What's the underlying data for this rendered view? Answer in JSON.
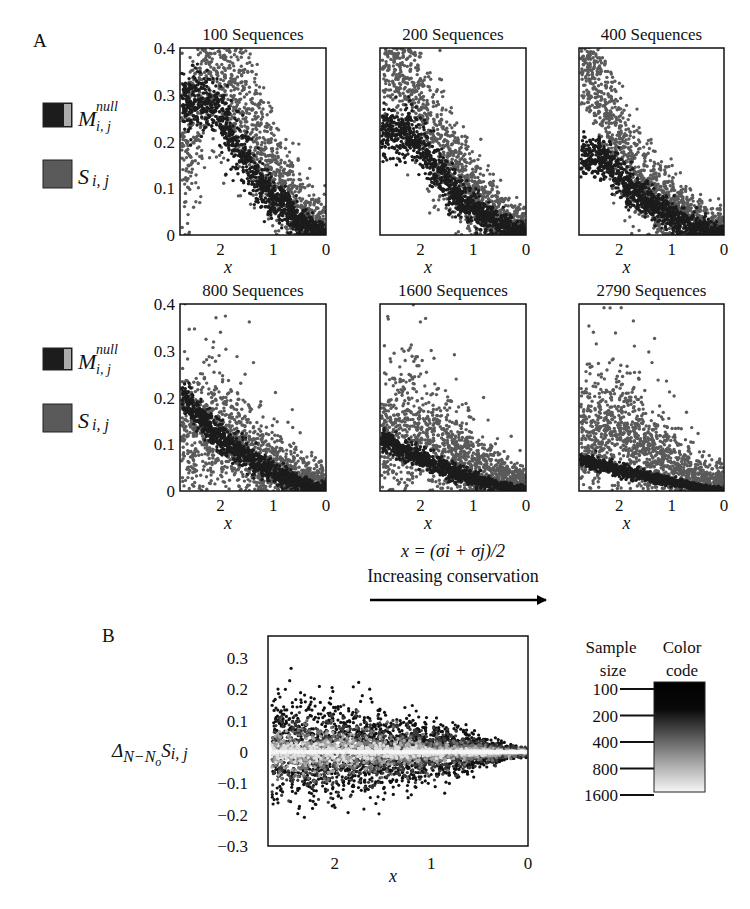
{
  "figure": {
    "panel_a_label": "A",
    "panel_b_label": "B",
    "x_definition": "x = (σi + σj)/2",
    "arrow_caption": "Increasing conservation"
  },
  "legend_a": [
    {
      "symbol": "M",
      "sup": "null",
      "sub": "i, j",
      "color": "#1c1c1c"
    },
    {
      "symbol": "S",
      "sup": "",
      "sub": "i, j",
      "color": "#5a5a5a"
    }
  ],
  "colors": {
    "null_model": "#1c1c1c",
    "observed": "#5a5a5a",
    "frame": "#111111"
  },
  "chart_data": [
    {
      "type": "scatter",
      "panel": "A1",
      "title": "100 Sequences",
      "xlabel": "x",
      "ylabel": "",
      "xlim": [
        2.77,
        0
      ],
      "ylim": [
        0,
        0.4
      ],
      "xticks": [
        "2",
        "1",
        "0"
      ],
      "yticks": [
        "0",
        "0.1",
        "0.2",
        "0.3",
        "0.4"
      ],
      "series": [
        {
          "name": "S_ij",
          "color": "#5a5a5a",
          "profile": {
            "center": [
              [
                2.6,
                0.2
              ],
              [
                2.2,
                0.4
              ],
              [
                1.6,
                0.3
              ],
              [
                1.0,
                0.12
              ],
              [
                0.3,
                0.02
              ]
            ],
            "spread": 0.16
          }
        },
        {
          "name": "M_null_ij",
          "color": "#1c1c1c",
          "profile": {
            "center": [
              [
                2.1,
                0.28
              ],
              [
                1.6,
                0.17
              ],
              [
                1.1,
                0.09
              ],
              [
                0.5,
                0.03
              ],
              [
                0.1,
                0.005
              ]
            ],
            "spread": 0.06
          }
        }
      ]
    },
    {
      "type": "scatter",
      "panel": "A2",
      "title": "200 Sequences",
      "xlabel": "x",
      "ylabel": "",
      "xlim": [
        2.77,
        0
      ],
      "ylim": [
        0,
        0.4
      ],
      "xticks": [
        "2",
        "1",
        "0"
      ],
      "yticks": [],
      "series": [
        {
          "name": "S_ij",
          "color": "#5a5a5a",
          "profile": {
            "center": [
              [
                2.6,
                0.4
              ],
              [
                2.1,
                0.3
              ],
              [
                1.6,
                0.18
              ],
              [
                1.0,
                0.08
              ],
              [
                0.3,
                0.02
              ]
            ],
            "spread": 0.12
          }
        },
        {
          "name": "M_null_ij",
          "color": "#1c1c1c",
          "profile": {
            "center": [
              [
                2.2,
                0.22
              ],
              [
                1.7,
                0.14
              ],
              [
                1.2,
                0.07
              ],
              [
                0.6,
                0.03
              ],
              [
                0.1,
                0.005
              ]
            ],
            "spread": 0.05
          }
        }
      ]
    },
    {
      "type": "scatter",
      "panel": "A3",
      "title": "400 Sequences",
      "xlabel": "x",
      "ylabel": "",
      "xlim": [
        2.77,
        0
      ],
      "ylim": [
        0,
        0.4
      ],
      "xticks": [
        "2",
        "1",
        "0"
      ],
      "yticks": [],
      "series": [
        {
          "name": "S_ij",
          "color": "#5a5a5a",
          "profile": {
            "center": [
              [
                2.7,
                0.38
              ],
              [
                2.3,
                0.28
              ],
              [
                1.8,
                0.15
              ],
              [
                1.2,
                0.07
              ],
              [
                0.3,
                0.015
              ]
            ],
            "spread": 0.1
          }
        },
        {
          "name": "M_null_ij",
          "color": "#1c1c1c",
          "profile": {
            "center": [
              [
                2.3,
                0.17
              ],
              [
                1.8,
                0.1
              ],
              [
                1.2,
                0.05
              ],
              [
                0.6,
                0.02
              ],
              [
                0.1,
                0.004
              ]
            ],
            "spread": 0.04
          }
        }
      ]
    },
    {
      "type": "scatter",
      "panel": "A4",
      "title": "800 Sequences",
      "xlabel": "x",
      "ylabel": "",
      "xlim": [
        2.77,
        0
      ],
      "ylim": [
        0,
        0.4
      ],
      "xticks": [
        "2",
        "1",
        "0"
      ],
      "yticks": [
        "0",
        "0.1",
        "0.2",
        "0.3",
        "0.4"
      ],
      "series": [
        {
          "name": "S_ij",
          "color": "#5a5a5a",
          "profile": {
            "center": [
              [
                2.6,
                0.12
              ],
              [
                2.1,
                0.14
              ],
              [
                1.6,
                0.1
              ],
              [
                1.0,
                0.05
              ],
              [
                0.3,
                0.01
              ]
            ],
            "spread": 0.1
          }
        },
        {
          "name": "M_null_ij",
          "color": "#1c1c1c",
          "profile": {
            "center": [
              [
                2.7,
                0.2
              ],
              [
                2.2,
                0.13
              ],
              [
                1.6,
                0.08
              ],
              [
                1.0,
                0.04
              ],
              [
                0.2,
                0.005
              ]
            ],
            "spread": 0.03
          }
        }
      ]
    },
    {
      "type": "scatter",
      "panel": "A5",
      "title": "1600 Sequences",
      "xlabel": "x",
      "ylabel": "",
      "xlim": [
        2.77,
        0
      ],
      "ylim": [
        0,
        0.4
      ],
      "xticks": [
        "2",
        "1",
        "0"
      ],
      "yticks": [],
      "series": [
        {
          "name": "S_ij",
          "color": "#5a5a5a",
          "profile": {
            "center": [
              [
                2.6,
                0.12
              ],
              [
                2.1,
                0.14
              ],
              [
                1.6,
                0.1
              ],
              [
                1.0,
                0.05
              ],
              [
                0.3,
                0.01
              ]
            ],
            "spread": 0.1
          }
        },
        {
          "name": "M_null_ij",
          "color": "#1c1c1c",
          "profile": {
            "center": [
              [
                2.7,
                0.11
              ],
              [
                2.2,
                0.08
              ],
              [
                1.6,
                0.05
              ],
              [
                1.0,
                0.025
              ],
              [
                0.2,
                0.004
              ]
            ],
            "spread": 0.02
          }
        }
      ]
    },
    {
      "type": "scatter",
      "panel": "A6",
      "title": "2790 Sequences",
      "xlabel": "x",
      "ylabel": "",
      "xlim": [
        2.77,
        0
      ],
      "ylim": [
        0,
        0.4
      ],
      "xticks": [
        "2",
        "1",
        "0"
      ],
      "yticks": [],
      "series": [
        {
          "name": "S_ij",
          "color": "#5a5a5a",
          "profile": {
            "center": [
              [
                2.6,
                0.12
              ],
              [
                2.1,
                0.14
              ],
              [
                1.6,
                0.1
              ],
              [
                1.0,
                0.05
              ],
              [
                0.3,
                0.01
              ]
            ],
            "spread": 0.1
          }
        },
        {
          "name": "M_null_ij",
          "color": "#1c1c1c",
          "profile": {
            "center": [
              [
                2.7,
                0.065
              ],
              [
                2.2,
                0.05
              ],
              [
                1.6,
                0.035
              ],
              [
                1.0,
                0.02
              ],
              [
                0.2,
                0.003
              ]
            ],
            "spread": 0.012
          }
        }
      ]
    },
    {
      "type": "scatter",
      "panel": "B",
      "title": "",
      "xlabel": "x",
      "ylabel": "ΔN−No Si, j",
      "xlim": [
        2.69,
        0
      ],
      "ylim": [
        -0.3,
        0.37
      ],
      "xticks": [
        "2",
        "1",
        "0"
      ],
      "yticks": [
        "0.3",
        "0.2",
        "0.1",
        "0",
        "−0.1",
        "−0.2",
        "−0.3"
      ],
      "ytick_values": [
        0.3,
        0.2,
        0.1,
        0,
        -0.1,
        -0.2,
        -0.3
      ],
      "series": [
        {
          "name": "100",
          "color": "#111111",
          "spread_at_x": [
            [
              2.6,
              0.13
            ],
            [
              2.0,
              0.12
            ],
            [
              1.0,
              0.07
            ],
            [
              0.1,
              0.01
            ]
          ]
        },
        {
          "name": "200",
          "color": "#3a3a3a",
          "spread_at_x": [
            [
              2.6,
              0.07
            ],
            [
              2.0,
              0.07
            ],
            [
              1.0,
              0.04
            ],
            [
              0.1,
              0.008
            ]
          ]
        },
        {
          "name": "400",
          "color": "#707070",
          "spread_at_x": [
            [
              2.6,
              0.045
            ],
            [
              2.0,
              0.045
            ],
            [
              1.0,
              0.025
            ],
            [
              0.1,
              0.005
            ]
          ]
        },
        {
          "name": "800",
          "color": "#a8a8a8",
          "spread_at_x": [
            [
              2.6,
              0.03
            ],
            [
              2.0,
              0.03
            ],
            [
              1.0,
              0.015
            ],
            [
              0.1,
              0.004
            ]
          ]
        },
        {
          "name": "1600",
          "color": "#dedede",
          "spread_at_x": [
            [
              2.6,
              0.015
            ],
            [
              2.0,
              0.015
            ],
            [
              1.0,
              0.008
            ],
            [
              0.1,
              0.002
            ]
          ]
        }
      ],
      "colorbar": {
        "title_left": [
          "Sample",
          "size"
        ],
        "title_right": [
          "Color",
          "code"
        ],
        "levels": [
          "100",
          "200",
          "400",
          "800",
          "1600"
        ],
        "gradient": [
          "#000000",
          "#1a1a1a",
          "#6e6e6e",
          "#b8b8b8",
          "#f4f4f4"
        ]
      }
    }
  ]
}
